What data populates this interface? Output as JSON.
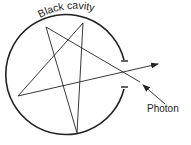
{
  "diagram": {
    "title_label": "Black cavity",
    "photon_label": "Photon",
    "colors": {
      "stroke": "#222222",
      "background": "#ffffff"
    }
  }
}
